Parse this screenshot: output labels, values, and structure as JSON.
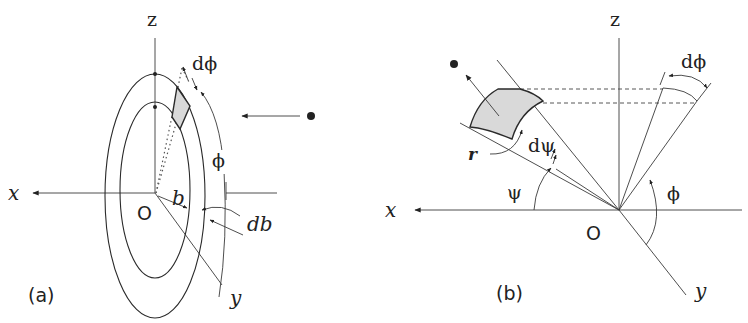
{
  "figure": {
    "panel_a": {
      "caption": "(a)",
      "axis_labels": {
        "z": "z",
        "x": "x",
        "y": "y",
        "origin": "O"
      },
      "symbols": {
        "impact_parameter": "b",
        "d_impact_parameter": "db",
        "azimuth": "ϕ",
        "d_azimuth": "dϕ"
      },
      "description": "Incident particle approaching ring of impact parameter b, width db, azimuthal element dϕ"
    },
    "panel_b": {
      "caption": "(b)",
      "axis_labels": {
        "z": "z",
        "x": "x",
        "y": "y",
        "origin": "O"
      },
      "symbols": {
        "scattering_angle": "ψ",
        "d_scattering_angle": "dψ",
        "azimuth": "ϕ",
        "d_azimuth": "dϕ",
        "radius": "r"
      },
      "description": "Scattered particle passing through solid-angle element at distance r, angles ψ and ϕ"
    },
    "colors": {
      "ink": "#2a2a2a",
      "patch_fill": "#d9d9d9",
      "background": "#ffffff"
    }
  }
}
